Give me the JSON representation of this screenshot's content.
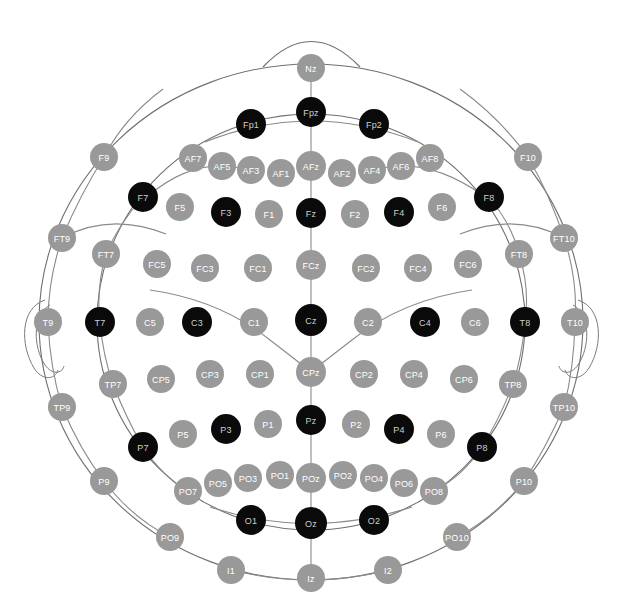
{
  "figure": {
    "kind": "eeg-electrode-montage",
    "title": "",
    "background_color": "#ffffff",
    "outline_color": "#6f6f6f",
    "connector_color": "#8a8a8a"
  },
  "legend": {
    "gray": {
      "label": "",
      "fill": "#999999",
      "text_color": "#ffffff"
    },
    "dark": {
      "label": "",
      "fill": "#0a0a0a",
      "text_color": "#cfcfcf"
    }
  },
  "geometry": {
    "width": 623,
    "height": 608,
    "center_x": 311,
    "center_y": 322,
    "outer_radius": 272,
    "inner_radius": 214,
    "dot_radius": 14,
    "dot_radius_small": 13
  },
  "electrodes": [
    {
      "name": "Nz",
      "x": 311,
      "y": 68,
      "state": "gray",
      "r": 14
    },
    {
      "name": "Fp1",
      "x": 251,
      "y": 124,
      "state": "dark",
      "r": 15
    },
    {
      "name": "Fpz",
      "x": 311,
      "y": 112,
      "state": "dark",
      "r": 15
    },
    {
      "name": "Fp2",
      "x": 374,
      "y": 124,
      "state": "dark",
      "r": 15
    },
    {
      "name": "F9",
      "x": 104,
      "y": 157,
      "state": "gray",
      "r": 14
    },
    {
      "name": "AF7",
      "x": 193,
      "y": 158,
      "state": "gray",
      "r": 14
    },
    {
      "name": "AF5",
      "x": 222,
      "y": 166,
      "state": "gray",
      "r": 14
    },
    {
      "name": "AF3",
      "x": 251,
      "y": 170,
      "state": "gray",
      "r": 14
    },
    {
      "name": "AF1",
      "x": 281,
      "y": 173,
      "state": "gray",
      "r": 14
    },
    {
      "name": "AFz",
      "x": 311,
      "y": 166,
      "state": "gray",
      "r": 15
    },
    {
      "name": "AF2",
      "x": 342,
      "y": 173,
      "state": "gray",
      "r": 14
    },
    {
      "name": "AF4",
      "x": 372,
      "y": 170,
      "state": "gray",
      "r": 14
    },
    {
      "name": "AF6",
      "x": 401,
      "y": 166,
      "state": "gray",
      "r": 14
    },
    {
      "name": "AF8",
      "x": 430,
      "y": 158,
      "state": "gray",
      "r": 14
    },
    {
      "name": "F10",
      "x": 528,
      "y": 157,
      "state": "gray",
      "r": 14
    },
    {
      "name": "F7",
      "x": 143,
      "y": 197,
      "state": "dark",
      "r": 15
    },
    {
      "name": "F5",
      "x": 180,
      "y": 207,
      "state": "gray",
      "r": 14
    },
    {
      "name": "F3",
      "x": 226,
      "y": 212,
      "state": "dark",
      "r": 15
    },
    {
      "name": "F1",
      "x": 269,
      "y": 214,
      "state": "gray",
      "r": 14
    },
    {
      "name": "Fz",
      "x": 311,
      "y": 213,
      "state": "dark",
      "r": 15
    },
    {
      "name": "F2",
      "x": 355,
      "y": 214,
      "state": "gray",
      "r": 14
    },
    {
      "name": "F4",
      "x": 399,
      "y": 212,
      "state": "dark",
      "r": 15
    },
    {
      "name": "F6",
      "x": 442,
      "y": 207,
      "state": "gray",
      "r": 14
    },
    {
      "name": "F8",
      "x": 489,
      "y": 197,
      "state": "dark",
      "r": 15
    },
    {
      "name": "FT9",
      "x": 62,
      "y": 238,
      "state": "gray",
      "r": 14
    },
    {
      "name": "FT7",
      "x": 106,
      "y": 254,
      "state": "gray",
      "r": 14
    },
    {
      "name": "FC5",
      "x": 157,
      "y": 264,
      "state": "gray",
      "r": 14
    },
    {
      "name": "FC3",
      "x": 205,
      "y": 268,
      "state": "gray",
      "r": 14
    },
    {
      "name": "FC1",
      "x": 258,
      "y": 268,
      "state": "gray",
      "r": 14
    },
    {
      "name": "FCz",
      "x": 311,
      "y": 265,
      "state": "gray",
      "r": 15
    },
    {
      "name": "FC2",
      "x": 366,
      "y": 268,
      "state": "gray",
      "r": 14
    },
    {
      "name": "FC4",
      "x": 418,
      "y": 268,
      "state": "gray",
      "r": 14
    },
    {
      "name": "FC6",
      "x": 468,
      "y": 264,
      "state": "gray",
      "r": 14
    },
    {
      "name": "FT8",
      "x": 519,
      "y": 254,
      "state": "gray",
      "r": 14
    },
    {
      "name": "FT10",
      "x": 564,
      "y": 238,
      "state": "gray",
      "r": 14
    },
    {
      "name": "T9",
      "x": 48,
      "y": 322,
      "state": "gray",
      "r": 14
    },
    {
      "name": "T7",
      "x": 100,
      "y": 322,
      "state": "dark",
      "r": 15
    },
    {
      "name": "C5",
      "x": 150,
      "y": 322,
      "state": "gray",
      "r": 14
    },
    {
      "name": "C3",
      "x": 197,
      "y": 322,
      "state": "dark",
      "r": 15
    },
    {
      "name": "C1",
      "x": 254,
      "y": 322,
      "state": "gray",
      "r": 14
    },
    {
      "name": "Cz",
      "x": 311,
      "y": 320,
      "state": "dark",
      "r": 16
    },
    {
      "name": "C2",
      "x": 368,
      "y": 322,
      "state": "gray",
      "r": 14
    },
    {
      "name": "C4",
      "x": 425,
      "y": 322,
      "state": "dark",
      "r": 15
    },
    {
      "name": "C6",
      "x": 475,
      "y": 322,
      "state": "gray",
      "r": 14
    },
    {
      "name": "T8",
      "x": 525,
      "y": 322,
      "state": "dark",
      "r": 15
    },
    {
      "name": "T10",
      "x": 575,
      "y": 322,
      "state": "gray",
      "r": 14
    },
    {
      "name": "TP9",
      "x": 62,
      "y": 407,
      "state": "gray",
      "r": 14
    },
    {
      "name": "TP7",
      "x": 113,
      "y": 384,
      "state": "gray",
      "r": 14
    },
    {
      "name": "CP5",
      "x": 161,
      "y": 379,
      "state": "gray",
      "r": 14
    },
    {
      "name": "CP3",
      "x": 210,
      "y": 374,
      "state": "gray",
      "r": 14
    },
    {
      "name": "CP1",
      "x": 260,
      "y": 374,
      "state": "gray",
      "r": 14
    },
    {
      "name": "CPz",
      "x": 311,
      "y": 372,
      "state": "gray",
      "r": 15
    },
    {
      "name": "CP2",
      "x": 364,
      "y": 374,
      "state": "gray",
      "r": 14
    },
    {
      "name": "CP4",
      "x": 414,
      "y": 374,
      "state": "gray",
      "r": 14
    },
    {
      "name": "CP6",
      "x": 464,
      "y": 379,
      "state": "gray",
      "r": 14
    },
    {
      "name": "TP8",
      "x": 513,
      "y": 384,
      "state": "gray",
      "r": 14
    },
    {
      "name": "TP10",
      "x": 564,
      "y": 407,
      "state": "gray",
      "r": 14
    },
    {
      "name": "P9",
      "x": 104,
      "y": 481,
      "state": "gray",
      "r": 14
    },
    {
      "name": "P7",
      "x": 143,
      "y": 447,
      "state": "dark",
      "r": 15
    },
    {
      "name": "P5",
      "x": 183,
      "y": 434,
      "state": "gray",
      "r": 14
    },
    {
      "name": "P3",
      "x": 226,
      "y": 429,
      "state": "dark",
      "r": 15
    },
    {
      "name": "P1",
      "x": 268,
      "y": 424,
      "state": "gray",
      "r": 14
    },
    {
      "name": "Pz",
      "x": 311,
      "y": 420,
      "state": "dark",
      "r": 15
    },
    {
      "name": "P2",
      "x": 356,
      "y": 424,
      "state": "gray",
      "r": 14
    },
    {
      "name": "P4",
      "x": 399,
      "y": 429,
      "state": "dark",
      "r": 15
    },
    {
      "name": "P6",
      "x": 441,
      "y": 434,
      "state": "gray",
      "r": 14
    },
    {
      "name": "P8",
      "x": 482,
      "y": 447,
      "state": "dark",
      "r": 15
    },
    {
      "name": "P10",
      "x": 524,
      "y": 481,
      "state": "gray",
      "r": 14
    },
    {
      "name": "PO9",
      "x": 170,
      "y": 537,
      "state": "gray",
      "r": 14
    },
    {
      "name": "PO7",
      "x": 188,
      "y": 491,
      "state": "gray",
      "r": 14
    },
    {
      "name": "PO5",
      "x": 218,
      "y": 483,
      "state": "gray",
      "r": 14
    },
    {
      "name": "PO3",
      "x": 248,
      "y": 478,
      "state": "gray",
      "r": 14
    },
    {
      "name": "PO1",
      "x": 280,
      "y": 475,
      "state": "gray",
      "r": 14
    },
    {
      "name": "POz",
      "x": 311,
      "y": 478,
      "state": "gray",
      "r": 15
    },
    {
      "name": "PO2",
      "x": 343,
      "y": 475,
      "state": "gray",
      "r": 14
    },
    {
      "name": "PO4",
      "x": 374,
      "y": 478,
      "state": "gray",
      "r": 14
    },
    {
      "name": "PO6",
      "x": 404,
      "y": 483,
      "state": "gray",
      "r": 14
    },
    {
      "name": "PO8",
      "x": 434,
      "y": 491,
      "state": "gray",
      "r": 14
    },
    {
      "name": "PO10",
      "x": 457,
      "y": 537,
      "state": "gray",
      "r": 14
    },
    {
      "name": "O1",
      "x": 251,
      "y": 520,
      "state": "dark",
      "r": 15
    },
    {
      "name": "Oz",
      "x": 311,
      "y": 523,
      "state": "dark",
      "r": 16
    },
    {
      "name": "O2",
      "x": 374,
      "y": 520,
      "state": "dark",
      "r": 15
    },
    {
      "name": "I1",
      "x": 231,
      "y": 570,
      "state": "gray",
      "r": 14
    },
    {
      "name": "Iz",
      "x": 311,
      "y": 578,
      "state": "gray",
      "r": 14
    },
    {
      "name": "I2",
      "x": 388,
      "y": 570,
      "state": "gray",
      "r": 14
    }
  ]
}
